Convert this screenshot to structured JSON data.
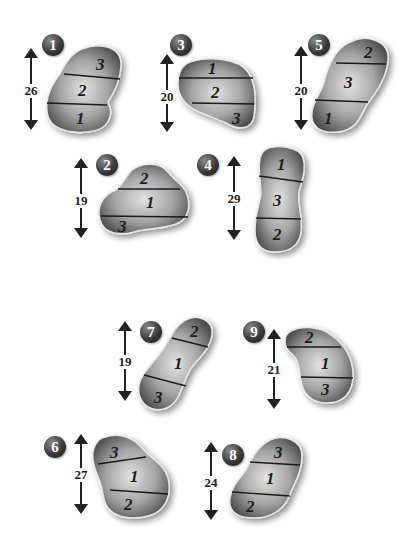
{
  "figures": [
    {
      "id": "1",
      "height": "26",
      "segments_top_to_bottom": [
        "3",
        "2",
        "1"
      ]
    },
    {
      "id": "3",
      "height": "20",
      "segments_top_to_bottom": [
        "1",
        "2",
        "3"
      ]
    },
    {
      "id": "5",
      "height": "20",
      "segments_top_to_bottom": [
        "2",
        "3",
        "1"
      ]
    },
    {
      "id": "2",
      "height": "19",
      "segments_top_to_bottom": [
        "2",
        "1",
        "3"
      ]
    },
    {
      "id": "4",
      "height": "29",
      "segments_top_to_bottom": [
        "1",
        "3",
        "2"
      ]
    },
    {
      "id": "7",
      "height": "19",
      "segments_top_to_bottom": [
        "2",
        "1",
        "3"
      ]
    },
    {
      "id": "9",
      "height": "21",
      "segments_top_to_bottom": [
        "2",
        "1",
        "3"
      ]
    },
    {
      "id": "6",
      "height": "27",
      "segments_top_to_bottom": [
        "3",
        "1",
        "2"
      ]
    },
    {
      "id": "8",
      "height": "24",
      "segments_top_to_bottom": [
        "3",
        "1",
        "2"
      ]
    }
  ],
  "colors": {
    "shape_dark": "#4a4a4a",
    "shape_light": "#d8d8d8",
    "badge": "#2e2e2e",
    "line": "#1a1a1a"
  }
}
